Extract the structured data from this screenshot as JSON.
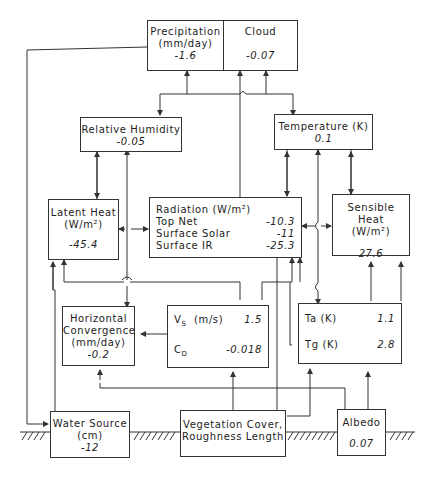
{
  "diagram": {
    "nodes": {
      "precipitation": {
        "label": "Precipitation",
        "unit": "(mm/day)",
        "value": "-1.6"
      },
      "cloud": {
        "label": "Cloud",
        "value": "-0.07"
      },
      "relative_humidity": {
        "label": "Relative Humidity",
        "value": "-0.05"
      },
      "temperature": {
        "label": "Temperature (K)",
        "value": "0.1"
      },
      "latent_heat": {
        "label": "Latent Heat",
        "unit": "(W/m²)",
        "value": "-45.4"
      },
      "radiation": {
        "label": "Radiation  (W/m²)",
        "rows": [
          {
            "label": "Top Net",
            "value": "-10.3"
          },
          {
            "label": "Surface Solar",
            "value": "-11"
          },
          {
            "label": "Surface IR",
            "value": "-25.3"
          }
        ]
      },
      "sensible_heat": {
        "label": "Sensible Heat",
        "unit": "(W/m²)",
        "value": "27.6"
      },
      "horizontal_convergence": {
        "label1": "Horizontal",
        "label2": "Convergence",
        "unit": "(mm/day)",
        "value": "-0.2"
      },
      "wind_drag": {
        "rows": [
          {
            "label": "Vs",
            "sub": "S",
            "base": "V",
            "unit": "(m/s)",
            "value": "1.5"
          },
          {
            "label": "CD",
            "sub": "D",
            "base": "C",
            "unit": "",
            "value": "-0.018"
          }
        ]
      },
      "surface_temps": {
        "rows": [
          {
            "label": "Ta (K)",
            "value": "1.1"
          },
          {
            "label": "Tg (K)",
            "value": "2.8"
          }
        ]
      },
      "water_source": {
        "label": "Water Source",
        "unit": "(cm)",
        "value": "-12"
      },
      "vegetation": {
        "label1": "Vegetation Cover,",
        "label2": "Roughness Length"
      },
      "albedo": {
        "label": "Albedo",
        "value": "0.07"
      }
    },
    "ground_hatch": "////"
  }
}
